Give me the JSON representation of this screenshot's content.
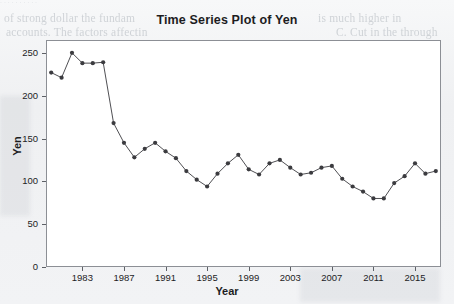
{
  "figure": {
    "title": "Time Series Plot of Yen",
    "background_color": "#f2f3f5",
    "plot_background_color": "#ffffff",
    "frame_color": "#8c8f95",
    "series_color": "#3b3b3f"
  },
  "background_bleed_text": {
    "line1": "of strong dollar the fundam",
    "line2": "accounts. The factors affectin",
    "line3": "is much higher in",
    "line4": "C. Cut in the through",
    "top_edge": "· · · · · · · · · ·"
  },
  "axes": {
    "ylabel": "Yen",
    "xlabel": "Year",
    "y_ticks": [
      "0",
      "50",
      "100",
      "150",
      "200",
      "250"
    ],
    "x_ticks": [
      "1983",
      "1987",
      "1991",
      "1995",
      "1999",
      "2003",
      "2007",
      "2011",
      "2015"
    ]
  },
  "chart_data": {
    "type": "line",
    "title": "Time Series Plot of Yen",
    "xlabel": "Year",
    "ylabel": "Yen",
    "xlim": [
      1979.5,
      2017.5
    ],
    "ylim": [
      0,
      265
    ],
    "ytick_values": [
      0,
      50,
      100,
      150,
      200,
      250
    ],
    "xtick_values": [
      1983,
      1987,
      1991,
      1995,
      1999,
      2003,
      2007,
      2011,
      2015
    ],
    "grid": false,
    "legend": "none",
    "marker": "filled-circle",
    "x": [
      1980,
      1981,
      1982,
      1983,
      1984,
      1985,
      1986,
      1987,
      1988,
      1989,
      1990,
      1991,
      1992,
      1993,
      1994,
      1995,
      1996,
      1997,
      1998,
      1999,
      2000,
      2001,
      2002,
      2003,
      2004,
      2005,
      2006,
      2007,
      2008,
      2009,
      2010,
      2011,
      2012,
      2013,
      2014,
      2015,
      2016,
      2017
    ],
    "values": [
      227,
      221,
      250,
      238,
      238,
      239,
      168,
      145,
      128,
      138,
      145,
      135,
      127,
      112,
      102,
      94,
      109,
      121,
      131,
      114,
      108,
      121,
      125,
      116,
      108,
      110,
      116,
      118,
      103,
      94,
      88,
      80,
      80,
      98,
      106,
      121,
      109,
      112
    ],
    "series": [
      {
        "name": "Yen",
        "x": [
          1980,
          1981,
          1982,
          1983,
          1984,
          1985,
          1986,
          1987,
          1988,
          1989,
          1990,
          1991,
          1992,
          1993,
          1994,
          1995,
          1996,
          1997,
          1998,
          1999,
          2000,
          2001,
          2002,
          2003,
          2004,
          2005,
          2006,
          2007,
          2008,
          2009,
          2010,
          2011,
          2012,
          2013,
          2014,
          2015,
          2016,
          2017
        ],
        "values": [
          227,
          221,
          250,
          238,
          238,
          239,
          168,
          145,
          128,
          138,
          145,
          135,
          127,
          112,
          102,
          94,
          109,
          121,
          131,
          114,
          108,
          121,
          125,
          116,
          108,
          110,
          116,
          118,
          103,
          94,
          88,
          80,
          80,
          98,
          106,
          121,
          109,
          112
        ]
      }
    ]
  }
}
